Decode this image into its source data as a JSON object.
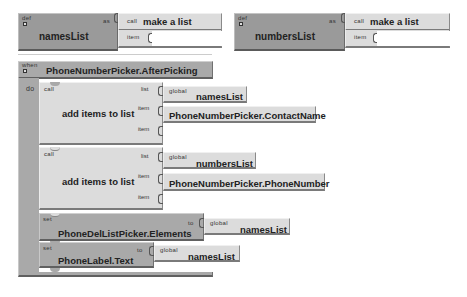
{
  "globals": [
    {
      "keyword": "def",
      "name": "namesList",
      "as_label": "as",
      "value_block": {
        "call_label": "call",
        "name": "make a list",
        "item_label": "item"
      }
    },
    {
      "keyword": "def",
      "name": "numbersList",
      "as_label": "as",
      "value_block": {
        "call_label": "call",
        "name": "make a list",
        "item_label": "item"
      }
    }
  ],
  "event": {
    "when_label": "when",
    "name": "PhoneNumberPicker.AfterPicking",
    "do_label": "do",
    "statements": [
      {
        "type": "call",
        "call_label": "call",
        "name": "add items to list",
        "sockets": [
          {
            "label": "list",
            "value": {
              "scope": "global",
              "name": "namesList"
            }
          },
          {
            "label": "item",
            "value": {
              "name": "PhoneNumberPicker.ContactName"
            }
          },
          {
            "label": "item",
            "value": null
          }
        ]
      },
      {
        "type": "call",
        "call_label": "call",
        "name": "add items to list",
        "sockets": [
          {
            "label": "list",
            "value": {
              "scope": "global",
              "name": "numbersList"
            }
          },
          {
            "label": "item",
            "value": {
              "name": "PhoneNumberPicker.PhoneNumber"
            }
          },
          {
            "label": "item",
            "value": null
          }
        ]
      },
      {
        "type": "set",
        "set_label": "set",
        "name": "PhoneDelListPicker.Elements",
        "to_label": "to",
        "value": {
          "scope": "global",
          "name": "namesList"
        }
      },
      {
        "type": "set",
        "set_label": "set",
        "name": "PhoneLabel.Text",
        "to_label": "to",
        "value": {
          "scope": "global",
          "name": "namesList"
        }
      }
    ]
  },
  "colors": {
    "definition_block": "#9a9a9a",
    "event_block": "#a9a9a9",
    "call_block": "#dcdcdc",
    "value_block": "#dcdcdc",
    "background": "#ffffff"
  }
}
